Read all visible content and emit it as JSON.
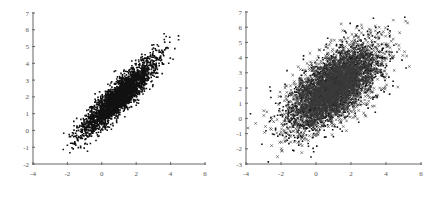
{
  "chart_data": [
    {
      "type": "scatter",
      "title": "",
      "xlabel": "",
      "ylabel": "",
      "xlim": [
        -4,
        6
      ],
      "ylim": [
        -2,
        7
      ],
      "xticks": [
        -4,
        -2,
        0,
        2,
        4,
        6
      ],
      "yticks": [
        -2,
        -1,
        0,
        1,
        2,
        3,
        4,
        5,
        6,
        7
      ],
      "grid": false,
      "legend": null,
      "marker": "dot",
      "marker_color": "#111111",
      "distribution": {
        "kind": "bivariate-normal",
        "n": 3000,
        "mean": [
          1.0,
          2.0
        ],
        "sd": [
          1.05,
          1.1
        ],
        "correlation": 0.9,
        "seed": 17
      },
      "plot_box": {
        "x0": 33,
        "x1": 205,
        "y_bottom": 164,
        "y_top": 13
      }
    },
    {
      "type": "scatter",
      "title": "",
      "xlabel": "",
      "ylabel": "",
      "xlim": [
        -4,
        6
      ],
      "ylim": [
        -3,
        7
      ],
      "xticks": [
        -4,
        -2,
        0,
        2,
        4,
        6
      ],
      "yticks": [
        -3,
        -2,
        -1,
        0,
        1,
        2,
        3,
        4,
        5,
        6,
        7
      ],
      "grid": false,
      "legend": null,
      "marker": "cross-and-dot",
      "marker_color": "#111111",
      "distribution": {
        "kind": "bivariate-normal",
        "n": 5000,
        "mean": [
          1.0,
          2.0
        ],
        "sd": [
          1.3,
          1.4
        ],
        "correlation": 0.62,
        "seed": 29
      },
      "plot_box": {
        "x0": 24,
        "x1": 199,
        "y_bottom": 164,
        "y_top": 12
      }
    }
  ]
}
